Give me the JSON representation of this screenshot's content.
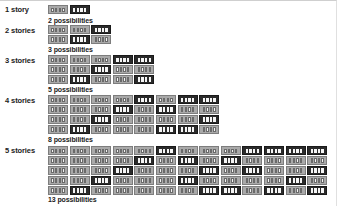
{
  "colors": {
    "light_block": "#a9a9a9",
    "dark_block": "#2b2b2b",
    "window": "#f2f2f2"
  },
  "legend_note": "L = light single-story block, D = dark double-story block (stacked top to bottom)",
  "rows": [
    {
      "label": "1 story",
      "possibilities": "2 possibilities",
      "top": 5,
      "poss_top": 17,
      "columns": [
        [
          "L"
        ],
        [
          "D"
        ]
      ]
    },
    {
      "label": "2 stories",
      "possibilities": "3 possibilities",
      "top": 25,
      "poss_top": 47,
      "columns": [
        [
          "L",
          "L"
        ],
        [
          "L",
          "D"
        ],
        [
          "D",
          "L"
        ]
      ]
    },
    {
      "label": "3 stories",
      "possibilities": "5 possibilities",
      "top": 55,
      "poss_top": 87,
      "columns": [
        [
          "L",
          "L",
          "L"
        ],
        [
          "L",
          "L",
          "D"
        ],
        [
          "L",
          "D",
          "L"
        ],
        [
          "D",
          "L",
          "L"
        ],
        [
          "D",
          "L",
          "D"
        ]
      ]
    },
    {
      "label": "4 stories",
      "possibilities": "8 possibilities",
      "top": 95,
      "poss_top": 137,
      "columns": [
        [
          "L",
          "L",
          "L",
          "L"
        ],
        [
          "L",
          "L",
          "L",
          "D"
        ],
        [
          "L",
          "L",
          "D",
          "L"
        ],
        [
          "L",
          "D",
          "L",
          "L"
        ],
        [
          "D",
          "L",
          "L",
          "L"
        ],
        [
          "L",
          "D",
          "L",
          "D"
        ],
        [
          "D",
          "L",
          "L",
          "D"
        ],
        [
          "D",
          "L",
          "D",
          "L"
        ]
      ]
    },
    {
      "label": "5 stories",
      "possibilities": "13 possibilities",
      "top": 146,
      "poss_top": 197,
      "columns": [
        [
          "L",
          "L",
          "L",
          "L",
          "L"
        ],
        [
          "L",
          "L",
          "L",
          "L",
          "D"
        ],
        [
          "L",
          "L",
          "L",
          "D",
          "L"
        ],
        [
          "L",
          "L",
          "D",
          "L",
          "L"
        ],
        [
          "L",
          "D",
          "L",
          "L",
          "L"
        ],
        [
          "D",
          "L",
          "L",
          "L",
          "L"
        ],
        [
          "L",
          "D",
          "L",
          "D",
          "L"
        ],
        [
          "L",
          "L",
          "D",
          "L",
          "D"
        ],
        [
          "L",
          "D",
          "L",
          "L",
          "D"
        ],
        [
          "D",
          "L",
          "D",
          "L",
          "L"
        ],
        [
          "D",
          "L",
          "L",
          "L",
          "D"
        ],
        [
          "D",
          "L",
          "L",
          "D",
          "L"
        ],
        [
          "D",
          "L",
          "D",
          "L",
          "D"
        ]
      ]
    }
  ]
}
